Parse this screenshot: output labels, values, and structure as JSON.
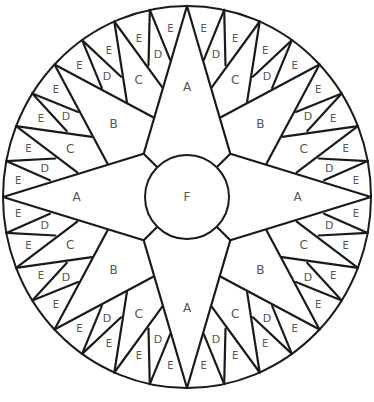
{
  "diagram": {
    "center": [
      187,
      197
    ],
    "outer_radius": [
      184,
      191
    ],
    "center_circle_radius": 42,
    "line_color": "#1a1a1a",
    "label_color": "#555555",
    "pieces": {
      "A": {
        "label": "A",
        "count": 4,
        "description": "main cardinal star points"
      },
      "B": {
        "label": "B",
        "count": 4,
        "description": "diagonal star points"
      },
      "C": {
        "label": "C",
        "count": 8,
        "description": "secondary points"
      },
      "D": {
        "label": "D",
        "count": 16,
        "description": "tertiary points"
      },
      "E": {
        "label": "E",
        "count": 32,
        "description": "background wedges at rim"
      },
      "F": {
        "label": "F",
        "count": 1,
        "description": "center circle"
      }
    },
    "geometry_octant": {
      "comment": "polar points [radius_fraction_or_px, degrees_from_A_axis]; R = outer radius",
      "P": [
        0,
        11.25,
        22.5,
        33.75,
        45
      ],
      "Q1": [
        140,
        7.0
      ],
      "Q2": [
        114,
        12.7
      ],
      "X": [
        139,
        16.3
      ],
      "Bv": [
        87,
        22.5
      ],
      "Y": [
        139,
        28.7
      ],
      "S2": [
        114,
        32.3
      ],
      "S1": [
        140,
        38.0
      ],
      "Ac": [
        62,
        45
      ]
    },
    "labels": {
      "A": {
        "text": "A",
        "r": 112,
        "deg": 0,
        "size": 12
      },
      "B": {
        "text": "B",
        "r": 105,
        "deg": 45,
        "size": 12
      },
      "C": {
        "text": "C",
        "r": 128,
        "deg": 22.5,
        "size": 12
      },
      "D": [
        {
          "text": "D",
          "r": 147,
          "deg": 11.5,
          "size": 11
        },
        {
          "text": "D",
          "r": 147,
          "deg": 33.5,
          "size": 11
        }
      ],
      "E": [
        {
          "text": "E",
          "r": 172,
          "deg": 5.6,
          "size": 10
        },
        {
          "text": "E",
          "r": 168,
          "deg": 16.9,
          "size": 10
        },
        {
          "text": "E",
          "r": 168,
          "deg": 28.1,
          "size": 10
        },
        {
          "text": "E",
          "r": 172,
          "deg": 39.4,
          "size": 10
        }
      ],
      "F": {
        "text": "F",
        "size": 12
      }
    }
  }
}
